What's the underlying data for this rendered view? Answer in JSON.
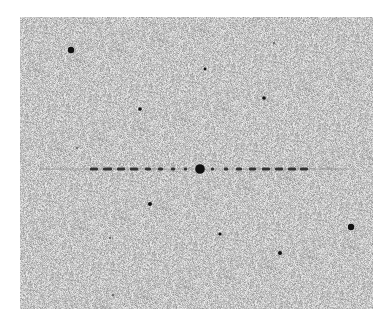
{
  "image": {
    "description": "Grayscale astronomical frame with noisy background, a bright star with horizontal diffraction/streak pattern, and scattered point sources",
    "background_color": "#c4c4c4",
    "star_color": "#111111",
    "frame": {
      "x": 20,
      "y": 17,
      "width": 353,
      "height": 292
    }
  },
  "stars": [
    {
      "x": 71,
      "y": 50,
      "r": 3.2
    },
    {
      "x": 140,
      "y": 109,
      "r": 1.8
    },
    {
      "x": 205,
      "y": 69,
      "r": 1.4
    },
    {
      "x": 264,
      "y": 98,
      "r": 1.8
    },
    {
      "x": 274,
      "y": 43,
      "r": 1.0
    },
    {
      "x": 77,
      "y": 148,
      "r": 1.0
    },
    {
      "x": 150,
      "y": 204,
      "r": 2.0
    },
    {
      "x": 220,
      "y": 234,
      "r": 1.6
    },
    {
      "x": 280,
      "y": 253,
      "r": 2.0
    },
    {
      "x": 351,
      "y": 227,
      "r": 3.2
    },
    {
      "x": 110,
      "y": 238,
      "r": 1.0
    },
    {
      "x": 113,
      "y": 295,
      "r": 1.0
    }
  ],
  "bright_star": {
    "x": 200,
    "y": 169,
    "r": 4.8
  },
  "streak": {
    "y": 169,
    "left_dashes": [
      [
        90,
        98
      ],
      [
        103,
        112
      ],
      [
        117,
        125
      ],
      [
        130,
        138
      ],
      [
        145,
        151
      ],
      [
        158,
        163
      ],
      [
        171,
        175
      ],
      [
        184,
        187
      ]
    ],
    "right_dashes": [
      [
        211,
        214
      ],
      [
        224,
        228
      ],
      [
        236,
        242
      ],
      [
        249,
        256
      ],
      [
        262,
        270
      ],
      [
        275,
        283
      ],
      [
        288,
        296
      ],
      [
        300,
        308
      ]
    ],
    "faint_extent": [
      40,
      355
    ]
  }
}
